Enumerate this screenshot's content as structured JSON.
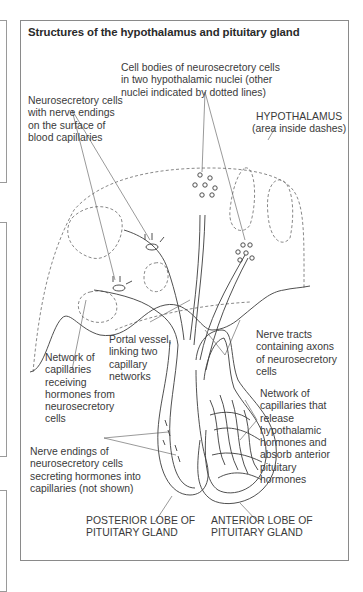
{
  "figure": {
    "title": "Structures of the hypothalamus and pituitary gland",
    "labels": {
      "cell_bodies": [
        "Cell bodies of neurosecretory cells",
        "in two hypothalamic nuclei (other",
        "nuclei indicated by dotted lines)"
      ],
      "neurosecretory_endings": [
        "Neurosecretory cells",
        "with nerve endings",
        "on the surface of",
        "blood capillaries"
      ],
      "hypothalamus": [
        "HYPOTHALAMUS",
        "(area inside dashes)"
      ],
      "portal_vessel": [
        "Portal vessel,",
        "linking two",
        "capillary",
        "networks"
      ],
      "nerve_tracts": [
        "Nerve tracts",
        "containing axons",
        "of neurosecretory",
        "cells"
      ],
      "network_receiving": [
        "Network of",
        "capillaries",
        "receiving",
        "hormones from",
        "neurosecretory",
        "cells"
      ],
      "network_release": [
        "Network of",
        "capillaries that",
        "release",
        "hypothalamic",
        "hormones and",
        "absorb anterior",
        "pituitary",
        "hormones"
      ],
      "nerve_endings_secreting": [
        "Nerve endings of",
        "neurosecretory cells",
        "secreting hormones into",
        "capillaries (not shown)"
      ],
      "posterior_lobe": [
        "POSTERIOR LOBE OF",
        "PITUITARY GLAND"
      ],
      "anterior_lobe": [
        "ANTERIOR LOBE OF",
        "PITUITARY GLAND"
      ]
    }
  },
  "colors": {
    "line": "#3c3c3c",
    "dashed": "#6a6a6a",
    "frame": "#8a8a8a",
    "text": "#3a3a3a"
  }
}
